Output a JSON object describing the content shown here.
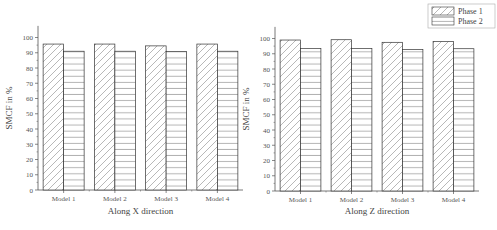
{
  "chart_data": [
    {
      "type": "bar",
      "title": "",
      "xlabel": "Along X direction",
      "ylabel": "SMCF in %",
      "categories": [
        "Model 1",
        "Model 2",
        "Model 3",
        "Model 4"
      ],
      "series": [
        {
          "name": "Phase 1",
          "pattern": "diagonal-hatch",
          "values": [
            95.7,
            95.7,
            94.5,
            95.7
          ]
        },
        {
          "name": "Phase 2",
          "pattern": "horizontal-lines",
          "values": [
            91.0,
            91.0,
            90.8,
            91.0
          ]
        }
      ],
      "ylim": [
        0,
        105
      ],
      "yticks": [
        0,
        10,
        20,
        30,
        40,
        50,
        60,
        70,
        80,
        90,
        100
      ],
      "grid": false,
      "legend_position": "none"
    },
    {
      "type": "bar",
      "title": "",
      "xlabel": "Along Z direction",
      "ylabel": "SMCF in %",
      "categories": [
        "Model 1",
        "Model 2",
        "Model 3",
        "Model 4"
      ],
      "series": [
        {
          "name": "Phase 1",
          "pattern": "diagonal-hatch",
          "values": [
            99.0,
            99.2,
            97.5,
            98.0
          ]
        },
        {
          "name": "Phase 2",
          "pattern": "horizontal-lines",
          "values": [
            93.5,
            93.5,
            92.8,
            93.3
          ]
        }
      ],
      "ylim": [
        0,
        105
      ],
      "yticks": [
        0,
        10,
        20,
        30,
        40,
        50,
        60,
        70,
        80,
        90,
        100
      ],
      "grid": false,
      "legend_position": "top-right"
    }
  ],
  "legend": {
    "items": [
      {
        "label": "Phase 1",
        "pattern": "diagonal-hatch"
      },
      {
        "label": "Phase 2",
        "pattern": "horizontal-lines"
      }
    ]
  },
  "colors": {
    "axis": "#555555",
    "bar_stroke": "#333333",
    "hatch": "#777777",
    "background": "#ffffff"
  }
}
